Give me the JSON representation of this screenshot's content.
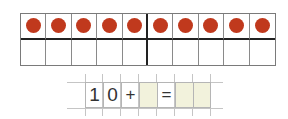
{
  "ten_frame": {
    "columns": 10,
    "rows": 2,
    "top_row_filled": [
      true,
      true,
      true,
      true,
      true,
      true,
      true,
      true,
      true,
      true
    ],
    "bottom_row_filled": [
      false,
      false,
      false,
      false,
      false,
      false,
      false,
      false,
      false,
      false
    ],
    "dot_color": "#c0391d",
    "dot_icon": "red-counter-dot"
  },
  "equation": {
    "cells": [
      {
        "text": "1",
        "shaded": false,
        "role": "digit"
      },
      {
        "text": "0",
        "shaded": false,
        "role": "digit"
      },
      {
        "text": "+",
        "shaded": false,
        "role": "operator"
      },
      {
        "text": "",
        "shaded": true,
        "role": "answer"
      },
      {
        "text": "=",
        "shaded": false,
        "role": "operator"
      },
      {
        "text": "",
        "shaded": true,
        "role": "answer"
      },
      {
        "text": "",
        "shaded": true,
        "role": "answer"
      }
    ],
    "shade_color": "#f2f2dc"
  }
}
